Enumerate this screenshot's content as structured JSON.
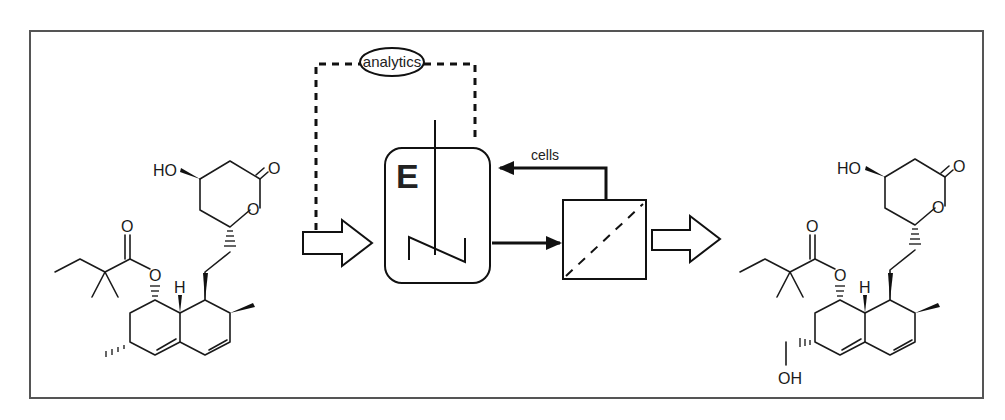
{
  "diagram": {
    "type": "bioprocess-scheme",
    "frame": {
      "x": 30,
      "y": 31,
      "width": 953,
      "height": 367,
      "border_color": "#555555"
    },
    "nodes": {
      "analytics": {
        "label": "analytics",
        "shape": "ellipse"
      },
      "reactor": {
        "label": "E",
        "shape": "rounded-rect",
        "contains": "stirrer"
      },
      "filter": {
        "label": "",
        "shape": "square",
        "contains": "dashed-diagonal-membrane"
      },
      "substrate": {
        "label": "",
        "shape": "chemical-structure",
        "atoms": [
          "HO",
          "O",
          "O",
          "O",
          "O",
          "H"
        ]
      },
      "product": {
        "label": "",
        "shape": "chemical-structure",
        "atoms": [
          "HO",
          "O",
          "O",
          "O",
          "O",
          "H",
          "OH"
        ]
      }
    },
    "edges": [
      {
        "from": "substrate",
        "to": "reactor",
        "style": "hollow-arrow"
      },
      {
        "from": "analytics",
        "to": "reactor",
        "style": "dashed"
      },
      {
        "from": "substrate-feed",
        "to": "analytics",
        "style": "dashed"
      },
      {
        "from": "reactor",
        "to": "filter",
        "style": "solid-arrow"
      },
      {
        "from": "filter",
        "to": "reactor",
        "style": "solid-arrow",
        "label": "cells"
      },
      {
        "from": "filter",
        "to": "product",
        "style": "hollow-arrow"
      }
    ],
    "labels": {
      "analytics": "analytics",
      "reactor": "E",
      "recycle": "cells",
      "substrate_ho": "HO",
      "substrate_o_lactone_carbonyl": "O",
      "substrate_o_ring": "O",
      "substrate_o_ester_carbonyl": "O",
      "substrate_o_ester": "O",
      "substrate_h": "H",
      "product_ho": "HO",
      "product_o_lactone_carbonyl": "O",
      "product_o_ring": "O",
      "product_o_ester_carbonyl": "O",
      "product_o_ester": "O",
      "product_h": "H",
      "product_oh": "OH"
    }
  }
}
